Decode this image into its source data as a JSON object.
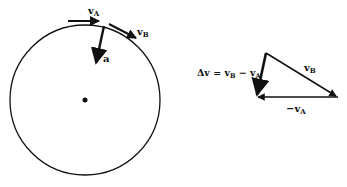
{
  "diagram": {
    "circle": {
      "center": [
        85,
        100
      ],
      "radius": 75
    },
    "labels": {
      "vA": "v",
      "vA_sub": "A",
      "vB": "v",
      "vB_sub": "B",
      "a": "a",
      "delta_v_eq": "Δv = v",
      "delta_v_sub_B": "B",
      "delta_v_minus": " − v",
      "delta_v_sub_A": "A",
      "tri_vB": "v",
      "tri_vB_sub": "B",
      "tri_neg_vA": "−v",
      "tri_neg_vA_sub": "A"
    },
    "colors": {
      "ink": "#111111",
      "background": "#ffffff"
    }
  }
}
